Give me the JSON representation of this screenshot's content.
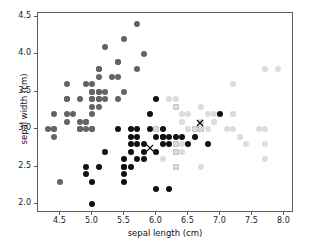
{
  "chart_data": {
    "type": "scatter",
    "title": "",
    "xlabel": "sepal length (cm)",
    "ylabel": "sepal width (cm)",
    "xlim": [
      4.15,
      8.15
    ],
    "ylim": [
      1.88,
      4.55
    ],
    "xticks": [
      "4.5",
      "5.0",
      "5.5",
      "6.0",
      "6.5",
      "7.0",
      "7.5",
      "8.0"
    ],
    "xtick_values": [
      4.5,
      5.0,
      5.5,
      6.0,
      6.5,
      7.0,
      7.5,
      8.0
    ],
    "yticks": [
      "2.0",
      "2.5",
      "3.0",
      "3.5",
      "4.0",
      "4.5"
    ],
    "ytick_values": [
      2.0,
      2.5,
      3.0,
      3.5,
      4.0,
      4.5
    ],
    "grid": false,
    "legend": "none",
    "marker": "circle",
    "marker_size": 6,
    "colors": {
      "cluster_0": "#636363",
      "cluster_1": "#101010",
      "cluster_2": "#dcdcdc",
      "centroid": "#000000",
      "axis": "#5a5a5a"
    },
    "series": [
      {
        "name": "cluster_0",
        "color": "#636363",
        "points": [
          [
            4.3,
            3.0
          ],
          [
            4.4,
            2.9
          ],
          [
            4.4,
            3.0
          ],
          [
            4.4,
            3.2
          ],
          [
            4.5,
            2.3
          ],
          [
            4.6,
            3.1
          ],
          [
            4.6,
            3.4
          ],
          [
            4.6,
            3.6
          ],
          [
            4.6,
            3.2
          ],
          [
            4.7,
            3.2
          ],
          [
            4.8,
            3.0
          ],
          [
            4.8,
            3.4
          ],
          [
            4.8,
            3.1
          ],
          [
            4.9,
            3.0
          ],
          [
            4.9,
            3.1
          ],
          [
            4.9,
            3.6
          ],
          [
            5.0,
            3.0
          ],
          [
            5.0,
            3.2
          ],
          [
            5.0,
            3.3
          ],
          [
            5.0,
            3.4
          ],
          [
            5.0,
            3.5
          ],
          [
            5.0,
            3.6
          ],
          [
            5.1,
            3.3
          ],
          [
            5.1,
            3.4
          ],
          [
            5.1,
            3.5
          ],
          [
            5.1,
            3.7
          ],
          [
            5.1,
            3.8
          ],
          [
            5.2,
            3.4
          ],
          [
            5.2,
            3.5
          ],
          [
            5.2,
            4.1
          ],
          [
            5.3,
            3.7
          ],
          [
            5.4,
            3.4
          ],
          [
            5.4,
            3.7
          ],
          [
            5.4,
            3.9
          ],
          [
            5.5,
            3.5
          ],
          [
            5.5,
            4.2
          ],
          [
            5.7,
            3.8
          ],
          [
            5.7,
            4.4
          ],
          [
            5.8,
            4.0
          ],
          [
            4.8,
            3.0
          ],
          [
            5.1,
            3.5
          ],
          [
            5.0,
            3.4
          ],
          [
            4.9,
            3.1
          ],
          [
            5.4,
            3.9
          ],
          [
            5.1,
            3.8
          ],
          [
            4.6,
            3.4
          ],
          [
            5.0,
            3.5
          ],
          [
            4.4,
            3.0
          ],
          [
            5.1,
            3.4
          ],
          [
            5.0,
            3.0
          ]
        ]
      },
      {
        "name": "cluster_1",
        "color": "#101010",
        "points": [
          [
            4.9,
            2.4
          ],
          [
            4.9,
            2.5
          ],
          [
            5.0,
            2.0
          ],
          [
            5.0,
            2.3
          ],
          [
            5.1,
            2.5
          ],
          [
            5.2,
            2.7
          ],
          [
            5.4,
            3.0
          ],
          [
            5.5,
            2.3
          ],
          [
            5.5,
            2.4
          ],
          [
            5.5,
            2.5
          ],
          [
            5.5,
            2.6
          ],
          [
            5.6,
            2.5
          ],
          [
            5.6,
            2.7
          ],
          [
            5.6,
            2.8
          ],
          [
            5.6,
            2.9
          ],
          [
            5.6,
            3.0
          ],
          [
            5.7,
            2.6
          ],
          [
            5.7,
            2.8
          ],
          [
            5.7,
            2.9
          ],
          [
            5.7,
            3.0
          ],
          [
            5.8,
            2.6
          ],
          [
            5.8,
            2.7
          ],
          [
            5.8,
            2.8
          ],
          [
            5.9,
            3.0
          ],
          [
            5.9,
            3.2
          ],
          [
            6.0,
            2.2
          ],
          [
            6.0,
            2.7
          ],
          [
            6.0,
            2.9
          ],
          [
            6.0,
            3.0
          ],
          [
            6.0,
            3.4
          ],
          [
            6.1,
            2.8
          ],
          [
            6.1,
            2.9
          ],
          [
            6.1,
            3.0
          ],
          [
            6.2,
            2.2
          ],
          [
            6.2,
            2.8
          ],
          [
            6.2,
            2.9
          ],
          [
            6.3,
            2.5
          ],
          [
            6.3,
            2.7
          ],
          [
            6.3,
            2.8
          ],
          [
            6.3,
            2.9
          ],
          [
            6.3,
            3.3
          ],
          [
            6.4,
            2.9
          ],
          [
            6.5,
            2.8
          ],
          [
            6.6,
            2.9
          ],
          [
            6.6,
            3.0
          ],
          [
            6.7,
            3.0
          ],
          [
            6.8,
            2.8
          ],
          [
            7.0,
            3.2
          ],
          [
            5.5,
            2.5
          ],
          [
            6.1,
            2.9
          ]
        ]
      },
      {
        "name": "cluster_2",
        "color": "#dcdcdc",
        "points": [
          [
            6.0,
            3.0
          ],
          [
            6.1,
            2.6
          ],
          [
            6.2,
            3.4
          ],
          [
            6.3,
            2.5
          ],
          [
            6.3,
            2.7
          ],
          [
            6.3,
            2.8
          ],
          [
            6.3,
            3.3
          ],
          [
            6.3,
            3.4
          ],
          [
            6.4,
            2.7
          ],
          [
            6.4,
            2.8
          ],
          [
            6.4,
            3.1
          ],
          [
            6.4,
            3.2
          ],
          [
            6.5,
            3.0
          ],
          [
            6.5,
            3.2
          ],
          [
            6.6,
            3.0
          ],
          [
            6.7,
            2.5
          ],
          [
            6.7,
            3.0
          ],
          [
            6.7,
            3.1
          ],
          [
            6.7,
            3.3
          ],
          [
            6.8,
            3.0
          ],
          [
            6.8,
            3.2
          ],
          [
            6.9,
            3.1
          ],
          [
            6.9,
            3.2
          ],
          [
            7.1,
            3.0
          ],
          [
            7.2,
            3.0
          ],
          [
            7.2,
            3.2
          ],
          [
            7.2,
            3.6
          ],
          [
            7.3,
            2.9
          ],
          [
            7.4,
            2.8
          ],
          [
            7.6,
            3.0
          ],
          [
            7.7,
            2.6
          ],
          [
            7.7,
            2.8
          ],
          [
            7.7,
            3.0
          ],
          [
            7.7,
            3.8
          ],
          [
            7.9,
            3.8
          ],
          [
            6.5,
            3.0
          ],
          [
            6.9,
            3.1
          ],
          [
            6.7,
            3.1
          ],
          [
            7.2,
            3.2
          ],
          [
            6.4,
            3.1
          ]
        ]
      }
    ],
    "centroids": [
      {
        "name": "centroid_cluster_1",
        "x": 5.9,
        "y": 2.75,
        "marker": "x"
      },
      {
        "name": "centroid_cluster_2",
        "x": 6.68,
        "y": 3.08,
        "marker": "x"
      }
    ]
  }
}
